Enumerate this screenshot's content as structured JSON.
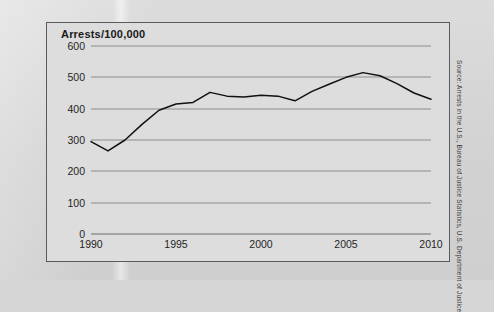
{
  "figure": {
    "title": "Arrests/100,000",
    "source_note": "Source: Arrests in the U.S., Bureau of Justice Statistics, U.S. Department of Justice"
  },
  "chart_data": {
    "type": "line",
    "title": "Arrests/100,000",
    "xlabel": "",
    "ylabel": "Arrests/100,000",
    "xlim": [
      1990,
      2010
    ],
    "ylim": [
      0,
      600
    ],
    "grid": true,
    "legend": false,
    "yticks": [
      0,
      100,
      200,
      300,
      400,
      500,
      600
    ],
    "xticks": [
      1990,
      1995,
      2000,
      2005,
      2010
    ],
    "x": [
      1990,
      1991,
      1992,
      1993,
      1994,
      1995,
      1996,
      1997,
      1998,
      1999,
      2000,
      2001,
      2002,
      2003,
      2004,
      2005,
      2006,
      2007,
      2008,
      2009,
      2010
    ],
    "series": [
      {
        "name": "Arrests per 100,000",
        "color": "#111111",
        "values": [
          295,
          265,
          300,
          350,
          395,
          415,
          420,
          452,
          440,
          437,
          443,
          440,
          425,
          455,
          478,
          500,
          515,
          505,
          480,
          450,
          430
        ]
      }
    ]
  }
}
